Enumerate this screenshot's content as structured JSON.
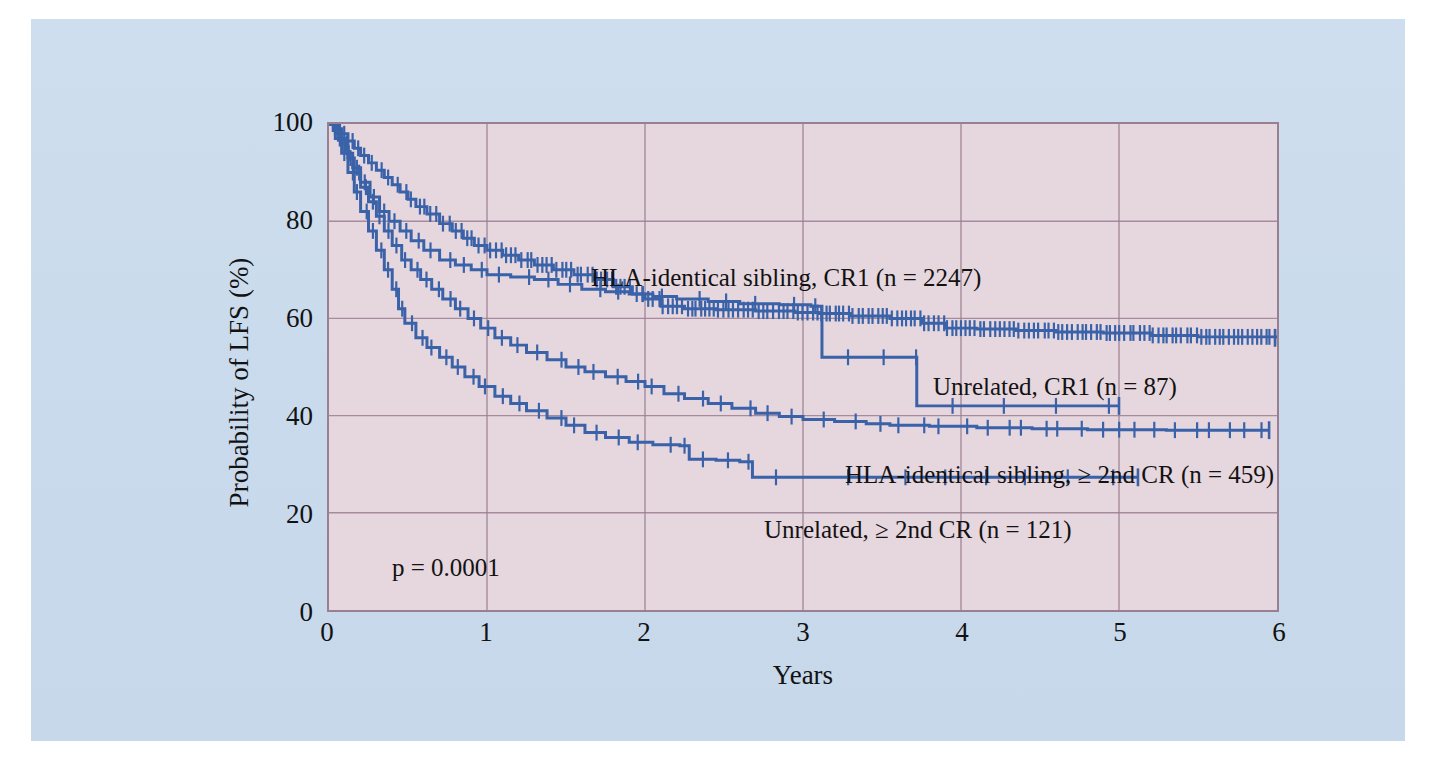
{
  "figure": {
    "panel_background": "#ccdcec",
    "plot_background": "#e6d6de",
    "grid_color": "#9a7f92",
    "curve_color": "#3a62a8",
    "axis_color": "#9a7f92"
  },
  "axes": {
    "x_title": "Years",
    "y_title": "Probability of LFS (%)",
    "x_ticks": [
      "0",
      "1",
      "2",
      "3",
      "4",
      "5",
      "6"
    ],
    "y_ticks": [
      "100",
      "80",
      "60",
      "40",
      "20",
      "0"
    ]
  },
  "annotations": {
    "p_value": "p = 0.0001",
    "label_sibling_cr1": "HLA-identical sibling, CR1 (n = 2247)",
    "label_unrelated_cr1": "Unrelated, CR1 (n = 87)",
    "label_sibling_2nd": "HLA-identical sibling, ≥ 2nd CR (n = 459)",
    "label_unrelated_2nd": "Unrelated, ≥ 2nd CR (n = 121)"
  },
  "chart_data": {
    "type": "line",
    "title": "",
    "subtitle": "",
    "xlabel": "Years",
    "ylabel": "Probability of LFS (%)",
    "xlim": [
      0,
      6
    ],
    "ylim": [
      0,
      100
    ],
    "xticks": [
      0,
      1,
      2,
      3,
      4,
      5,
      6
    ],
    "yticks": [
      0,
      20,
      40,
      60,
      80,
      100
    ],
    "grid": true,
    "legend_position": "in-plot-annotations",
    "statistic": "p = 0.0001",
    "curve_style": "kaplan-meier step with censoring tick marks",
    "series": [
      {
        "name": "HLA-identical sibling, CR1",
        "n": 2247,
        "color": "#3a62a8",
        "end_x": 6.0,
        "end_y": 56,
        "points": [
          [
            0.0,
            100
          ],
          [
            0.05,
            99
          ],
          [
            0.08,
            98
          ],
          [
            0.12,
            96.5
          ],
          [
            0.16,
            95
          ],
          [
            0.2,
            93.5
          ],
          [
            0.25,
            92
          ],
          [
            0.3,
            90.5
          ],
          [
            0.35,
            89
          ],
          [
            0.4,
            87.5
          ],
          [
            0.45,
            86
          ],
          [
            0.5,
            84.5
          ],
          [
            0.55,
            83
          ],
          [
            0.62,
            81.5
          ],
          [
            0.7,
            79.5
          ],
          [
            0.78,
            78
          ],
          [
            0.85,
            76.5
          ],
          [
            0.92,
            75
          ],
          [
            1.0,
            74
          ],
          [
            1.1,
            73
          ],
          [
            1.2,
            72
          ],
          [
            1.3,
            71
          ],
          [
            1.42,
            70
          ],
          [
            1.55,
            69
          ],
          [
            1.68,
            68
          ],
          [
            1.8,
            66.5
          ],
          [
            1.92,
            65
          ],
          [
            2.0,
            64
          ],
          [
            2.1,
            62.5
          ],
          [
            2.25,
            62
          ],
          [
            2.45,
            61.8
          ],
          [
            2.7,
            61.5
          ],
          [
            2.95,
            61.2
          ],
          [
            3.1,
            61
          ],
          [
            3.3,
            60.5
          ],
          [
            3.55,
            60
          ],
          [
            3.75,
            59
          ],
          [
            3.9,
            58
          ],
          [
            4.1,
            57.8
          ],
          [
            4.35,
            57.5
          ],
          [
            4.6,
            57.2
          ],
          [
            4.9,
            57
          ],
          [
            5.2,
            56.5
          ],
          [
            5.5,
            56.2
          ],
          [
            6.0,
            56
          ]
        ],
        "censor_density": "very-high"
      },
      {
        "name": "Unrelated, CR1",
        "n": 87,
        "color": "#3a62a8",
        "end_x": 3.72,
        "end_y": 42,
        "points": [
          [
            0.0,
            100
          ],
          [
            0.06,
            97
          ],
          [
            0.1,
            94
          ],
          [
            0.15,
            91
          ],
          [
            0.2,
            88
          ],
          [
            0.26,
            85
          ],
          [
            0.32,
            82
          ],
          [
            0.38,
            80
          ],
          [
            0.45,
            78
          ],
          [
            0.52,
            76
          ],
          [
            0.6,
            74
          ],
          [
            0.7,
            72
          ],
          [
            0.8,
            71
          ],
          [
            0.9,
            70
          ],
          [
            1.0,
            69
          ],
          [
            1.15,
            68.5
          ],
          [
            1.3,
            68
          ],
          [
            1.45,
            67
          ],
          [
            1.6,
            66
          ],
          [
            1.75,
            65.5
          ],
          [
            1.9,
            65
          ],
          [
            2.05,
            64.5
          ],
          [
            2.2,
            64
          ],
          [
            2.4,
            63.5
          ],
          [
            2.6,
            63
          ],
          [
            2.85,
            62.8
          ],
          [
            3.05,
            62.5
          ],
          [
            3.12,
            52
          ],
          [
            3.35,
            52
          ],
          [
            3.7,
            52
          ],
          [
            3.72,
            42
          ],
          [
            4.4,
            42
          ],
          [
            5.0,
            42
          ]
        ],
        "censor_density": "low"
      },
      {
        "name": "HLA-identical sibling, ≥ 2nd CR",
        "n": 459,
        "color": "#3a62a8",
        "end_x": 5.95,
        "end_y": 37,
        "points": [
          [
            0.0,
            100
          ],
          [
            0.04,
            98
          ],
          [
            0.08,
            96
          ],
          [
            0.12,
            93
          ],
          [
            0.16,
            90
          ],
          [
            0.2,
            87
          ],
          [
            0.25,
            84
          ],
          [
            0.3,
            81
          ],
          [
            0.35,
            78
          ],
          [
            0.4,
            75
          ],
          [
            0.46,
            72
          ],
          [
            0.52,
            70
          ],
          [
            0.58,
            68
          ],
          [
            0.65,
            66
          ],
          [
            0.72,
            64
          ],
          [
            0.8,
            62
          ],
          [
            0.88,
            60
          ],
          [
            0.96,
            58
          ],
          [
            1.05,
            56
          ],
          [
            1.15,
            54.5
          ],
          [
            1.25,
            53
          ],
          [
            1.38,
            51.5
          ],
          [
            1.5,
            50
          ],
          [
            1.62,
            49
          ],
          [
            1.75,
            48
          ],
          [
            1.88,
            47
          ],
          [
            2.0,
            46
          ],
          [
            2.12,
            44.5
          ],
          [
            2.25,
            43.5
          ],
          [
            2.4,
            42.5
          ],
          [
            2.55,
            41.5
          ],
          [
            2.7,
            40.5
          ],
          [
            2.85,
            39.8
          ],
          [
            3.0,
            39.2
          ],
          [
            3.2,
            38.8
          ],
          [
            3.4,
            38.3
          ],
          [
            3.55,
            38
          ],
          [
            3.8,
            37.8
          ],
          [
            4.1,
            37.5
          ],
          [
            4.45,
            37.3
          ],
          [
            4.8,
            37.1
          ],
          [
            5.3,
            37
          ],
          [
            5.95,
            37
          ]
        ],
        "censor_density": "medium"
      },
      {
        "name": "Unrelated, ≥ 2nd CR",
        "n": 121,
        "color": "#3a62a8",
        "end_x": 5.12,
        "end_y": 27.3,
        "points": [
          [
            0.0,
            100
          ],
          [
            0.04,
            97
          ],
          [
            0.08,
            94
          ],
          [
            0.12,
            90
          ],
          [
            0.16,
            86
          ],
          [
            0.2,
            82
          ],
          [
            0.25,
            78
          ],
          [
            0.3,
            74
          ],
          [
            0.35,
            70
          ],
          [
            0.4,
            66
          ],
          [
            0.44,
            62
          ],
          [
            0.48,
            59
          ],
          [
            0.55,
            56
          ],
          [
            0.62,
            54
          ],
          [
            0.7,
            52
          ],
          [
            0.78,
            50
          ],
          [
            0.86,
            48
          ],
          [
            0.95,
            46
          ],
          [
            1.05,
            44
          ],
          [
            1.15,
            42.5
          ],
          [
            1.25,
            41
          ],
          [
            1.38,
            39.5
          ],
          [
            1.5,
            38
          ],
          [
            1.62,
            36.5
          ],
          [
            1.75,
            35.5
          ],
          [
            1.9,
            34.5
          ],
          [
            2.05,
            34
          ],
          [
            2.22,
            33.8
          ],
          [
            2.28,
            31
          ],
          [
            2.45,
            30.8
          ],
          [
            2.6,
            30.5
          ],
          [
            2.68,
            27.3
          ],
          [
            3.0,
            27.3
          ],
          [
            3.5,
            27.3
          ],
          [
            4.3,
            27.3
          ],
          [
            5.12,
            27.3
          ]
        ],
        "censor_density": "low"
      }
    ]
  }
}
